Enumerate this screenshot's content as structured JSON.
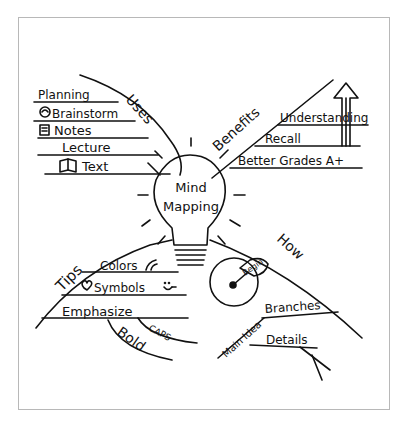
{
  "diagram": {
    "type": "mind-map",
    "center": {
      "line1": "Mind",
      "line2": "Mapping",
      "icon": "lightbulb-icon"
    },
    "branches": {
      "uses": {
        "label": "Uses",
        "items": [
          {
            "label": "Planning",
            "icon": ""
          },
          {
            "label": "Brainstorm",
            "icon": "brain-icon"
          },
          {
            "label": "Notes",
            "icon": "notepad-icon"
          },
          {
            "label": "Lecture",
            "icon": ""
          },
          {
            "label": "Text",
            "icon": "book-icon"
          }
        ]
      },
      "benefits": {
        "label": "Benefits",
        "items": [
          {
            "label": "Understanding"
          },
          {
            "label": "Recall"
          },
          {
            "label": "Better Grades A+"
          }
        ],
        "icon": "up-arrow-icon"
      },
      "tips": {
        "label": "Tips",
        "items": [
          {
            "label": "Colors",
            "icon": "rainbow-icon"
          },
          {
            "label": "Symbols",
            "icon": "heart-icon",
            "icon2": "smiley-icon"
          },
          {
            "label": "Emphasize",
            "sub": [
              "CAPS",
              "Bold"
            ]
          }
        ]
      },
      "how": {
        "label": "How",
        "start_label": "Begin",
        "start_icon": "clock-start-icon",
        "items": [
          {
            "label": "Main Idea"
          },
          {
            "label": "Branches"
          },
          {
            "label": "Details"
          }
        ]
      }
    }
  }
}
